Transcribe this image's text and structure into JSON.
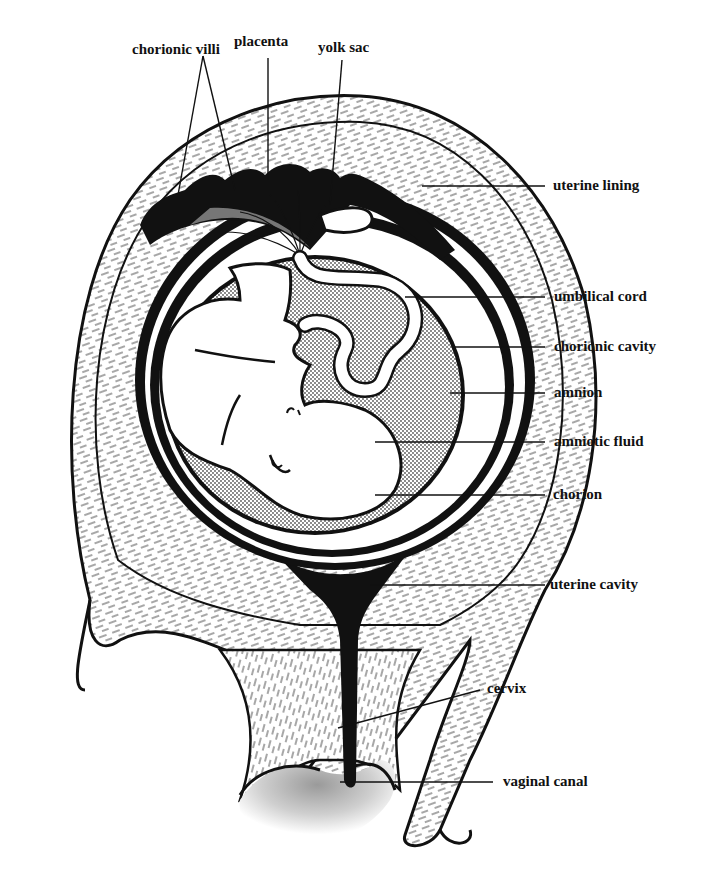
{
  "figure": {
    "colors": {
      "ink": "#111111",
      "background": "#ffffff",
      "stipple": "#bdbdbd"
    }
  },
  "labels": {
    "top": [
      {
        "id": "chorionic_villi",
        "text": "chorionic villi",
        "x": 132,
        "y": 50
      },
      {
        "id": "placenta",
        "text": "placenta",
        "x": 234,
        "y": 42
      },
      {
        "id": "yolk_sac",
        "text": "yolk sac",
        "x": 318,
        "y": 48
      }
    ],
    "right": [
      {
        "id": "uterine_lining",
        "text": "uterine lining",
        "x": 553,
        "y": 178
      },
      {
        "id": "umbilical_cord",
        "text": "umbilical cord",
        "x": 554,
        "y": 290
      },
      {
        "id": "chorionic_cavity",
        "text": "chorionic cavity",
        "x": 554,
        "y": 341
      },
      {
        "id": "amnion",
        "text": "amnion",
        "x": 554,
        "y": 387
      },
      {
        "id": "amniotic_fluid",
        "text": "amniotic fluid",
        "x": 554,
        "y": 435
      },
      {
        "id": "chorion",
        "text": "chorion",
        "x": 553,
        "y": 490
      },
      {
        "id": "uterine_cavity",
        "text": "uterine cavity",
        "x": 550,
        "y": 577
      },
      {
        "id": "cervix",
        "text": "cervix",
        "x": 487,
        "y": 683
      },
      {
        "id": "vaginal_canal",
        "text": "vaginal canal",
        "x": 503,
        "y": 774
      }
    ]
  }
}
